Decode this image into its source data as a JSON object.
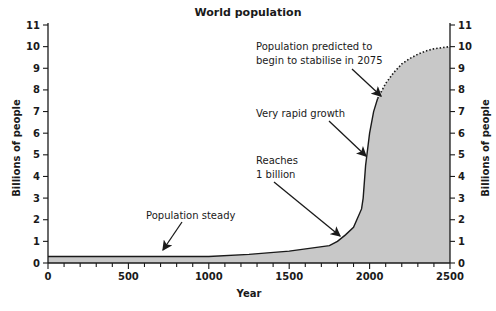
{
  "chart_data": {
    "type": "area",
    "title": "World population",
    "xlabel": "Year",
    "ylabel": "Billions of people",
    "ylabel_right": "Billions of people",
    "xlim": [
      0,
      2500
    ],
    "ylim": [
      0,
      11
    ],
    "x_ticks": [
      0,
      500,
      1000,
      1500,
      2000,
      2500
    ],
    "y_ticks": [
      0,
      1,
      2,
      3,
      4,
      5,
      6,
      7,
      8,
      9,
      10,
      11
    ],
    "grid": false,
    "series": [
      {
        "name": "Actual population",
        "style": "solid",
        "x": [
          0,
          1000,
          1250,
          1500,
          1750,
          1800,
          1850,
          1900,
          1950,
          1960,
          1975,
          2000,
          2025,
          2050
        ],
        "values": [
          0.3,
          0.3,
          0.4,
          0.55,
          0.8,
          1.0,
          1.3,
          1.65,
          2.5,
          3.0,
          4.5,
          6.0,
          7.0,
          7.6
        ]
      },
      {
        "name": "Predicted population",
        "style": "dotted",
        "x": [
          2050,
          2100,
          2150,
          2200,
          2250,
          2300,
          2350,
          2400,
          2450,
          2500
        ],
        "values": [
          7.6,
          8.3,
          8.8,
          9.2,
          9.45,
          9.65,
          9.8,
          9.9,
          9.95,
          10.0
        ]
      }
    ],
    "annotations": [
      {
        "text": "Population steady",
        "arrow_to": [
          700,
          0.3
        ]
      },
      {
        "text": "Reaches\n1 billion",
        "arrow_to": [
          1800,
          1.0
        ]
      },
      {
        "text": "Very rapid growth",
        "arrow_to": [
          1985,
          5.0
        ]
      },
      {
        "text": "Population predicted to\nbegin to stabilise in 2075",
        "arrow_to": [
          2075,
          7.5
        ]
      }
    ]
  },
  "labels": {
    "title": "World population",
    "xlabel": "Year",
    "ylabel": "Billions of people",
    "ylabel_right": "Billions of people",
    "annot_steady": "Population steady",
    "annot_billion_1": "Reaches",
    "annot_billion_2": "1 billion",
    "annot_rapid": "Very rapid growth",
    "annot_predict_1": "Population predicted to",
    "annot_predict_2": "begin to stabilise in 2075"
  },
  "colors": {
    "fill": "#c8c8c8",
    "line": "#1a1a1a"
  }
}
